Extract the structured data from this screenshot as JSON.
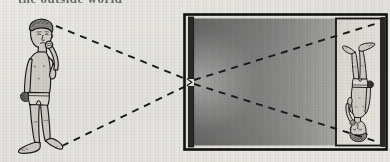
{
  "figure": {
    "caption_top": "the outside world",
    "background_color": "#f2f1ee",
    "ink_color": "#1c1c1c",
    "skin_fill": "#d9d7d2",
    "box_dark_fill": "#5d5d5d",
    "screen_fill": "#eceae5"
  },
  "subject": {
    "label": "boy standing outside",
    "pose": "standing, right hand raised to chin",
    "clothing": "shorts",
    "orientation": "upright",
    "position": "left of the box"
  },
  "camera_box": {
    "label": "dark box",
    "front_wall_label": "front wall with pinhole",
    "pinhole_label": "pinhole",
    "screen_label": "screen (back wall)",
    "interior_label": "dark interior"
  },
  "projected_image": {
    "label": "inverted image of the boy",
    "orientation": "upside-down",
    "location": "on the screen at the back of the box"
  },
  "rays": [
    {
      "name": "ray-from-head",
      "description": "light ray from the head passing through the pinhole to the bottom of the screen"
    },
    {
      "name": "ray-from-feet",
      "description": "light ray from the feet passing through the pinhole to the top of the screen"
    }
  ]
}
